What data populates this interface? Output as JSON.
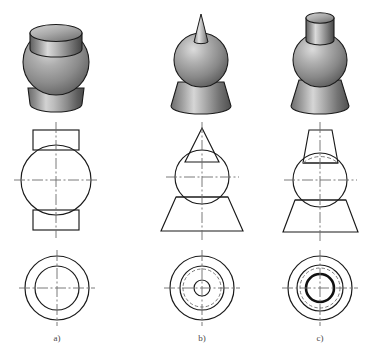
{
  "figure": {
    "background_color": "#ffffff",
    "line_color": "#1a1a1a",
    "centerline_color": "#6b6b6b",
    "hidden_line_color": "#7a7a7a",
    "caption_color": "#4a4a4a",
    "shading": {
      "highlight": "#d8d8d8",
      "midtone": "#9a9a9a",
      "shadow": "#575757",
      "deep_shadow": "#3d3d3d",
      "outline": "#1a1a1a"
    },
    "rows": [
      {
        "name": "pictorial-row",
        "label": "isometric shaded solids"
      },
      {
        "name": "front-view-row",
        "label": "front orthographic views"
      },
      {
        "name": "top-view-row",
        "label": "top orthographic views"
      }
    ],
    "columns": [
      {
        "id": "a",
        "caption": "a)",
        "description": "sphere with cylinder on top and cylinder at bottom",
        "pictorial": {
          "parts": [
            "top cylinder",
            "sphere",
            "bottom cylinder"
          ]
        },
        "front_view": {
          "elements": [
            "top rectangle",
            "circle",
            "bottom rectangle",
            "hidden arc top",
            "hidden arc bottom",
            "vertical centerline",
            "horizontal centerline"
          ]
        },
        "top_view": {
          "circle_count": 2,
          "elements": [
            "outer circle",
            "inner circle",
            "vertical centerline",
            "horizontal centerline"
          ]
        }
      },
      {
        "id": "b",
        "caption": "b)",
        "description": "sphere with cone spike on top and flared cone base",
        "pictorial": {
          "parts": [
            "cone spike",
            "sphere",
            "flared cone base"
          ]
        },
        "front_view": {
          "elements": [
            "top triangle",
            "circle",
            "bottom trapezoid",
            "chord line",
            "hidden arc bottom",
            "vertical centerline",
            "horizontal centerline"
          ]
        },
        "top_view": {
          "circle_count": 4,
          "elements": [
            "outer circle",
            "second circle",
            "hidden circle",
            "small inner circle",
            "vertical centerline",
            "horizontal centerline"
          ]
        }
      },
      {
        "id": "c",
        "caption": "c)",
        "description": "sphere with tapered cylinder on top and flared cone base",
        "pictorial": {
          "parts": [
            "tapered top cylinder",
            "sphere",
            "flared cone base"
          ]
        },
        "front_view": {
          "elements": [
            "top trapezoid",
            "circle",
            "bottom trapezoid",
            "chord line top",
            "chord line bottom",
            "hidden arc top",
            "hidden arc bottom",
            "vertical centerline",
            "horizontal centerline"
          ]
        },
        "top_view": {
          "circle_count": 4,
          "elements": [
            "outer circle",
            "second circle",
            "hidden circle",
            "heavy inner circle",
            "vertical centerline",
            "horizontal centerline"
          ]
        }
      }
    ]
  }
}
